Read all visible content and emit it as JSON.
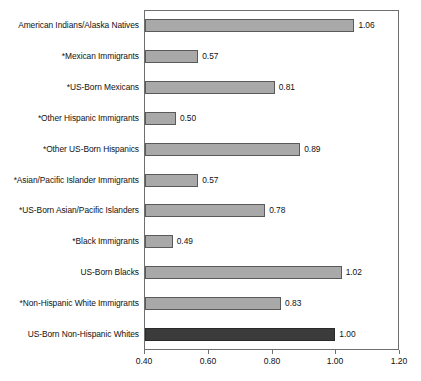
{
  "chart_data": {
    "type": "bar",
    "orientation": "horizontal",
    "title": "",
    "subtitle": "",
    "xlabel": "",
    "ylabel": "",
    "xlim": [
      0.4,
      1.2
    ],
    "xticks": [
      "0.40",
      "0.60",
      "0.80",
      "1.00",
      "1.20"
    ],
    "xtick_values": [
      0.4,
      0.6,
      0.8,
      1.0,
      1.2
    ],
    "grid": false,
    "legend": false,
    "reference_value": 1.0,
    "categories": [
      "American Indians/Alaska Natives",
      "*Mexican Immigrants",
      "*US-Born Mexicans",
      "*Other Hispanic Immigrants",
      "*Other US-Born Hispanics",
      "*Asian/Pacific Islander Immigrants",
      "*US-Born Asian/Pacific Islanders",
      "*Black Immigrants",
      "US-Born Blacks",
      "*Non-Hispanic White Immigrants",
      "US-Born Non-Hispanic Whites"
    ],
    "values": [
      1.06,
      0.57,
      0.81,
      0.5,
      0.89,
      0.57,
      0.78,
      0.49,
      1.02,
      0.83,
      1.0
    ],
    "value_labels": [
      "1.06",
      "0.57",
      "0.81",
      "0.50",
      "0.89",
      "0.57",
      "0.78",
      "0.49",
      "1.02",
      "0.83",
      "1.00"
    ],
    "bar_styles": [
      "light",
      "light",
      "light",
      "light",
      "light",
      "light",
      "light",
      "light",
      "light",
      "light",
      "dark"
    ],
    "colors": {
      "bar_light": "#a9a9a9",
      "bar_dark": "#3b3b3b",
      "bar_outline": "#5a5a5a",
      "axis": "#6f6f6f",
      "text": "#111111",
      "background": "#ffffff"
    }
  },
  "caption_fragment": ""
}
